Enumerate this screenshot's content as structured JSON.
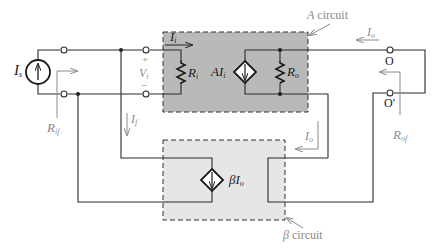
{
  "diagram": {
    "type": "feedback-amplifier-circuit",
    "colors": {
      "wire": "#2a2a2a",
      "annotation": "#8a8a8a",
      "a_box_fill": "#b9b9b9",
      "beta_box_fill": "#e6e6e6",
      "box_border": "#333333"
    },
    "labels": {
      "source": "I",
      "source_sub": "s",
      "input_current": "I",
      "input_current_sub": "i",
      "vi_plus": "+",
      "vi": "V",
      "vi_sub": "i",
      "vi_minus": "−",
      "ri": "R",
      "ri_sub": "i",
      "ai": "AI",
      "ai_sub": "i",
      "ro": "R",
      "ro_sub": "o",
      "a_circuit_italic": "A",
      "a_circuit_text": " circuit",
      "io_top": "I",
      "io_top_sub": "o",
      "terminal_o": "O",
      "terminal_o_prime": "O′",
      "rof": "R",
      "rof_sub": "of",
      "rif": "R",
      "rif_sub": "if",
      "if_label": "I",
      "if_label_sub": "f",
      "io_mid": "I",
      "io_mid_sub": "o",
      "beta_io": "βI",
      "beta_io_sub": "o",
      "beta_circuit_italic": "β",
      "beta_circuit_text": " circuit"
    }
  }
}
